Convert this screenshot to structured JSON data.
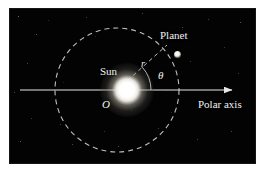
{
  "figure": {
    "kind": "polar-coordinates-orbit-diagram",
    "background_color": "#030303",
    "page_color": "#ffffff",
    "line_color": "#e8e8e8",
    "labels": {
      "planet": "Planet",
      "sun": "Sun",
      "polar_axis": "Polar axis",
      "origin": "O",
      "radius": "r",
      "angle": "θ"
    },
    "geometry": {
      "center_x": 117,
      "center_y": 90,
      "orbit_radius": 62,
      "sun_core_radius": 9,
      "planet_x": 167,
      "planet_y": 45,
      "axis_start_x": 20,
      "axis_end_x": 232,
      "axis_y": 90,
      "angle_degrees": 42,
      "angle_arc_radius": 34
    },
    "elements": {
      "orbit_circle_style": "dashed",
      "radius_line_style": "dashed",
      "polar_axis_style": "solid-with-arrowhead",
      "angle_arc_style": "solid"
    }
  },
  "stars": [
    {
      "x": 18,
      "y": 16,
      "s": 1.0,
      "o": 0.55
    },
    {
      "x": 36,
      "y": 34,
      "s": 1.2,
      "o": 0.45
    },
    {
      "x": 27,
      "y": 63,
      "s": 1.0,
      "o": 0.35
    },
    {
      "x": 14,
      "y": 92,
      "s": 1.1,
      "o": 0.4
    },
    {
      "x": 31,
      "y": 118,
      "s": 1.0,
      "o": 0.3
    },
    {
      "x": 20,
      "y": 141,
      "s": 1.3,
      "o": 0.5
    },
    {
      "x": 48,
      "y": 20,
      "s": 0.9,
      "o": 0.28
    },
    {
      "x": 60,
      "y": 124,
      "s": 1.0,
      "o": 0.3
    },
    {
      "x": 72,
      "y": 144,
      "s": 1.1,
      "o": 0.35
    },
    {
      "x": 86,
      "y": 17,
      "s": 1.0,
      "o": 0.3
    },
    {
      "x": 104,
      "y": 131,
      "s": 1.0,
      "o": 0.26
    },
    {
      "x": 118,
      "y": 146,
      "s": 1.2,
      "o": 0.4
    },
    {
      "x": 131,
      "y": 110,
      "s": 0.9,
      "o": 0.22
    },
    {
      "x": 142,
      "y": 13,
      "s": 1.1,
      "o": 0.38
    },
    {
      "x": 158,
      "y": 128,
      "s": 1.0,
      "o": 0.3
    },
    {
      "x": 171,
      "y": 112,
      "s": 0.9,
      "o": 0.24
    },
    {
      "x": 182,
      "y": 27,
      "s": 1.2,
      "o": 0.42
    },
    {
      "x": 190,
      "y": 61,
      "s": 1.0,
      "o": 0.3
    },
    {
      "x": 197,
      "y": 139,
      "s": 1.1,
      "o": 0.34
    },
    {
      "x": 208,
      "y": 19,
      "s": 1.0,
      "o": 0.33
    },
    {
      "x": 214,
      "y": 104,
      "s": 1.2,
      "o": 0.38
    },
    {
      "x": 224,
      "y": 47,
      "s": 1.0,
      "o": 0.28
    },
    {
      "x": 231,
      "y": 131,
      "s": 1.1,
      "o": 0.36
    },
    {
      "x": 238,
      "y": 73,
      "s": 1.0,
      "o": 0.3
    },
    {
      "x": 240,
      "y": 22,
      "s": 1.2,
      "o": 0.44
    },
    {
      "x": 166,
      "y": 90,
      "s": 0.9,
      "o": 0.2
    },
    {
      "x": 95,
      "y": 36,
      "s": 0.9,
      "o": 0.22
    },
    {
      "x": 63,
      "y": 82,
      "s": 0.9,
      "o": 0.2
    }
  ]
}
